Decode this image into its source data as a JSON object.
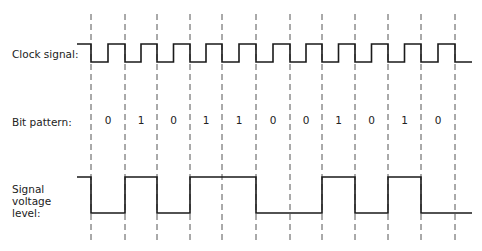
{
  "labels": {
    "clock": "Clock signal:",
    "bits": "Bit pattern:",
    "voltage_line1": "Signal",
    "voltage_line2": "voltage",
    "voltage_line3": "level:"
  },
  "bit_pattern": [
    "0",
    "1",
    "0",
    "1",
    "1",
    "0",
    "0",
    "1",
    "0",
    "1",
    "0"
  ],
  "grid_x": [
    91,
    125,
    157,
    190,
    222,
    256,
    290,
    322,
    355,
    388,
    421,
    455
  ],
  "colors": {
    "line": "#1a1a1a",
    "dash": "#555555",
    "background": "#ffffff"
  }
}
